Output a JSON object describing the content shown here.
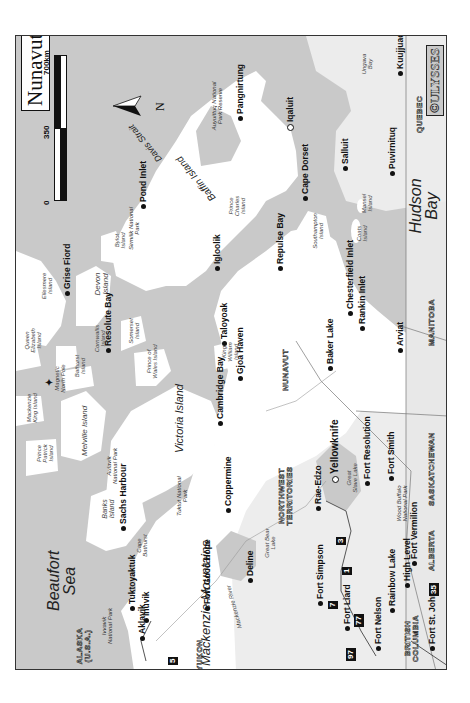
{
  "map": {
    "title": "Nunavut",
    "copyright": "©ULYSSES",
    "orientation": "rotated 90° counter-clockwise",
    "scale": {
      "ticks": [
        "0",
        "350",
        "700km"
      ]
    },
    "compass": {
      "label": "N"
    },
    "colors": {
      "water": "#c9c9c9",
      "land": "#ffffff",
      "other_land": "#e6e6e6",
      "text": "#111111",
      "frame": "#333333"
    },
    "seas": {
      "beaufort": "Beaufort Sea",
      "hudson": "Hudson Bay",
      "davis": "Davis Strait",
      "ungava": "Ungava Bay"
    },
    "regions": {
      "baffin": "Baffin Island",
      "victoria": "Victoria Island",
      "mackenzie_mtns": "Mackenzie Mountains",
      "mackenzie_river": "Mackenzie River",
      "river_label": "River",
      "great_bear": "Great Bear Lake",
      "great_slave": "Great Slave Lake"
    },
    "islands": {
      "ellesmere": "Ellesmere Island",
      "devon": "Devon Island",
      "bylot": "Bylot Island",
      "cornwallis": "Cornwallis Island",
      "queen_elizabeth": "Queen Elizabeth Island",
      "somerset": "Somerset Island",
      "prince_of_wales": "Prince of Wales Island",
      "bathurst": "Bathurst Island",
      "mackenzie_king": "Mackenzie King Island",
      "melville": "Melville Island",
      "prince_patrick": "Prince Patrick Island",
      "banks": "Banks Island",
      "king_william": "King William Island",
      "prince_charles": "Prince Charles Island",
      "southampton": "Southampton Island",
      "coats": "Coats Island",
      "mansel": "Mansel Island",
      "cape_bathurst": "Cape Bathurst",
      "magnetic_pole": "Magnetic North Pole"
    },
    "parks": {
      "auyuittuq": "Auyuittuq National Park Reserve",
      "sirmilik": "Sirmilik National Park",
      "aulavik": "Aulavik National Park",
      "tuktut": "Tuktut National Park",
      "wood_buffalo": "Wood Buffalo National Park",
      "ivvavik": "Ivvavik National Park"
    },
    "provinces": {
      "nunavut": "NUNAVUT",
      "nwt": "NORTHWEST TERRITORIES",
      "quebec": "QUEBEC",
      "manitoba": "MANITOBA",
      "saskatchewan": "SASKATCHEWAN",
      "alberta": "ALBERTA",
      "bc": "BRITISH COLUMBIA",
      "yukon": "YUKON",
      "alaska": "ALASKA (U.S.A.)"
    },
    "cities": {
      "iqaluit": "Iqaluit",
      "pangnirtung": "Pangnirtung",
      "kuujjuaq": "Kuujjuaq",
      "salluit": "Salluit",
      "puvirnituq": "Puvirnituq",
      "cape_dorset": "Cape Dorset",
      "pond_inlet": "Pond Inlet",
      "igloolik": "Igloolik",
      "grise_fiord": "Grise Fiord",
      "resolute_bay": "Resolute Bay",
      "taloyoak": "Taloyoak",
      "repulse_bay": "Repulse Bay",
      "chesterfield_inlet": "Chesterfield Inlet",
      "rankin_inlet": "Rankin Inlet",
      "baker_lake": "Baker Lake",
      "arviat": "Arviat",
      "gjoa_haven": "Gjoa Haven",
      "cambridge_bay": "Cambridge Bay",
      "sachs_harbour": "Sachs Harbour",
      "coppermine": "Coppermine",
      "rae_edzo": "Rae-Edzo",
      "yellowknife": "Yellowknife",
      "fort_resolution": "Fort Resolution",
      "fort_smith": "Fort Smith",
      "fort_vermilion": "Fort Vermilion",
      "high_level": "High Level",
      "rainbow_lake": "Rainbow Lake",
      "fort_simpson": "Fort Simpson",
      "fort_liard": "Fort Liard",
      "fort_nelson": "Fort Nelson",
      "fort_st_john": "Fort St. John",
      "fort_good_hope": "Fort Good Hope",
      "deline": "Deline",
      "tuktoyaktuk": "Tuktoyaktuk",
      "inuvik": "Inuvik",
      "aklavik": "Aklavik"
    },
    "highways": [
      "35",
      "1",
      "3",
      "7",
      "77",
      "97",
      "5"
    ]
  }
}
